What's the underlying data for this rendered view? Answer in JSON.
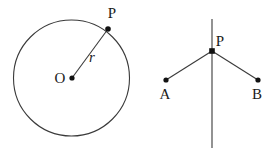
{
  "figure": {
    "background_color": "#ffffff",
    "stroke_color": "#3a3a3a",
    "point_color": "#111111",
    "label_color": "#1a1a1a",
    "diagrams": [
      {
        "name": "circle-radius-diagram",
        "circle": {
          "cx": 71.5,
          "cy": 78,
          "r": 58
        },
        "points": [
          {
            "id": "O",
            "label": "O",
            "x": 72,
            "y": 78,
            "label_x": 60,
            "label_y": 83
          },
          {
            "id": "P",
            "label": "P",
            "x": 108,
            "y": 29,
            "label_x": 112,
            "label_y": 18
          }
        ],
        "segments": [
          {
            "id": "OP",
            "from": "O",
            "to": "P",
            "label": "r",
            "label_x": 92,
            "label_y": 62
          }
        ]
      },
      {
        "name": "line-angle-diagram",
        "vertical_line": {
          "x": 212,
          "y1": 19,
          "y2": 148
        },
        "points": [
          {
            "id": "P",
            "label": "P",
            "x": 212,
            "y": 51,
            "label_x": 217,
            "label_y": 46
          },
          {
            "id": "A",
            "label": "A",
            "x": 166,
            "y": 80,
            "label_x": 160,
            "label_y": 99
          },
          {
            "id": "B",
            "label": "B",
            "x": 258,
            "y": 80,
            "label_x": 252,
            "label_y": 99
          }
        ],
        "segments": [
          {
            "id": "AP",
            "from": "A",
            "to": "P"
          },
          {
            "id": "PB",
            "from": "P",
            "to": "B"
          }
        ]
      }
    ]
  },
  "labels": {
    "circle_center": "O",
    "circle_point": "P",
    "radius": "r",
    "line_point": "P",
    "point_a": "A",
    "point_b": "B"
  }
}
